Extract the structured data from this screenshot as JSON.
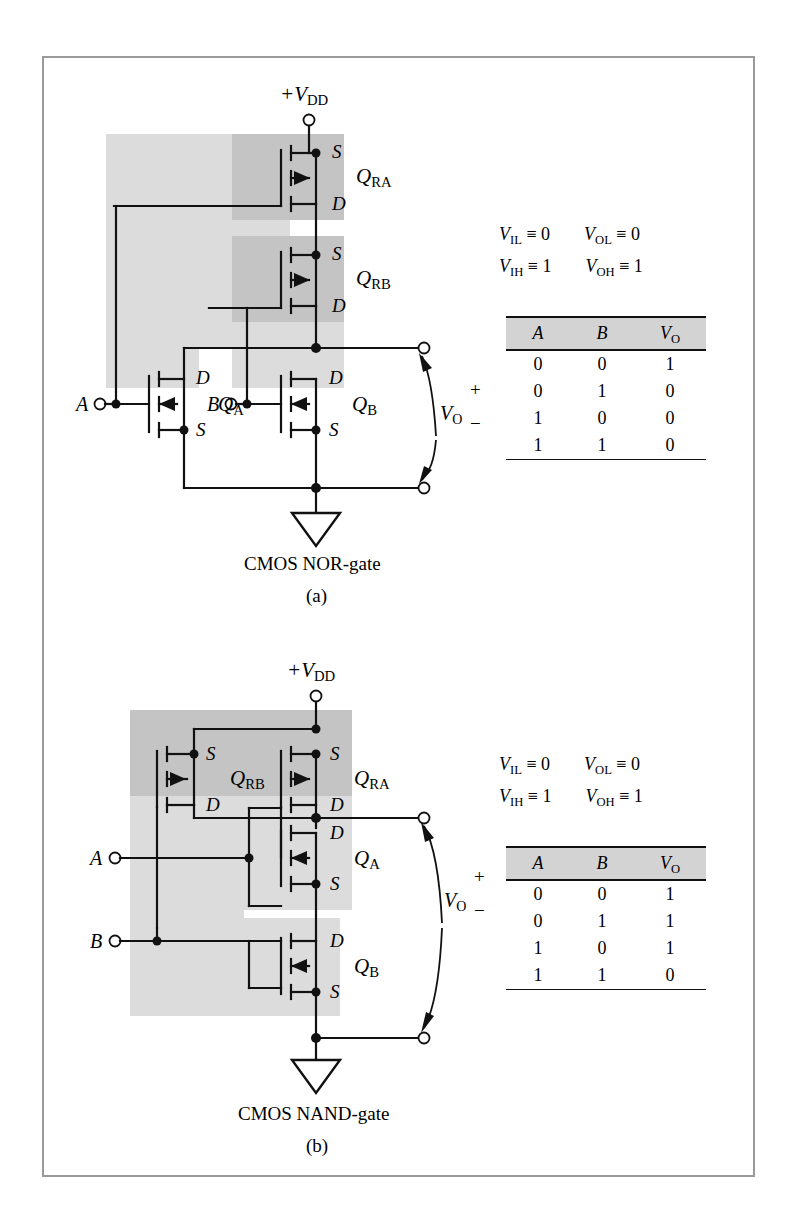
{
  "figure": {
    "frame_border_color": "#9a9a9a",
    "shade_light": "#dcdcdc",
    "shade_dark": "#c4c4c4",
    "wire_color": "#111111"
  },
  "nor": {
    "caption": "CMOS NOR-gate",
    "sub_caption": "(a)",
    "supply_label": "+V",
    "supply_sub": "DD",
    "input_a": "A",
    "input_b": "B",
    "output_label": "V",
    "output_sub": "O",
    "output_plus": "+",
    "output_minus": "−",
    "transistors": [
      {
        "name": "Q",
        "sub": "RA",
        "type": "pmos",
        "top_terminal": "S",
        "bottom_terminal": "D"
      },
      {
        "name": "Q",
        "sub": "RB",
        "type": "pmos",
        "top_terminal": "S",
        "bottom_terminal": "D"
      },
      {
        "name": "Q",
        "sub": "A",
        "type": "nmos",
        "top_terminal": "D",
        "bottom_terminal": "S"
      },
      {
        "name": "Q",
        "sub": "B",
        "type": "nmos",
        "top_terminal": "D",
        "bottom_terminal": "S"
      }
    ],
    "legend": [
      [
        {
          "v": "V",
          "sub": "IL",
          "rel": "≡",
          "val": "0"
        },
        {
          "v": "V",
          "sub": "OL",
          "rel": "≡",
          "val": "0"
        }
      ],
      [
        {
          "v": "V",
          "sub": "IH",
          "rel": "≡",
          "val": "1"
        },
        {
          "v": "V",
          "sub": "OH",
          "rel": "≡",
          "val": "1"
        }
      ]
    ],
    "truth_table": {
      "headers": [
        "A",
        "B",
        "V"
      ],
      "header_sub": [
        "",
        "",
        "O"
      ],
      "rows": [
        [
          "0",
          "0",
          "1"
        ],
        [
          "0",
          "1",
          "0"
        ],
        [
          "1",
          "0",
          "0"
        ],
        [
          "1",
          "1",
          "0"
        ]
      ]
    }
  },
  "nand": {
    "caption": "CMOS NAND-gate",
    "sub_caption": "(b)",
    "supply_label": "+V",
    "supply_sub": "DD",
    "input_a": "A",
    "input_b": "B",
    "output_label": "V",
    "output_sub": "O",
    "output_plus": "+",
    "output_minus": "−",
    "transistors": [
      {
        "name": "Q",
        "sub": "RB",
        "type": "pmos",
        "top_terminal": "S",
        "bottom_terminal": "D"
      },
      {
        "name": "Q",
        "sub": "RA",
        "type": "pmos",
        "top_terminal": "S",
        "bottom_terminal": "D"
      },
      {
        "name": "Q",
        "sub": "A",
        "type": "nmos",
        "top_terminal": "D",
        "bottom_terminal": "S"
      },
      {
        "name": "Q",
        "sub": "B",
        "type": "nmos",
        "top_terminal": "D",
        "bottom_terminal": "S"
      }
    ],
    "legend": [
      [
        {
          "v": "V",
          "sub": "IL",
          "rel": "≡",
          "val": "0"
        },
        {
          "v": "V",
          "sub": "OL",
          "rel": "≡",
          "val": "0"
        }
      ],
      [
        {
          "v": "V",
          "sub": "IH",
          "rel": "≡",
          "val": "1"
        },
        {
          "v": "V",
          "sub": "OH",
          "rel": "≡",
          "val": "1"
        }
      ]
    ],
    "truth_table": {
      "headers": [
        "A",
        "B",
        "V"
      ],
      "header_sub": [
        "",
        "",
        "O"
      ],
      "rows": [
        [
          "0",
          "0",
          "1"
        ],
        [
          "0",
          "1",
          "1"
        ],
        [
          "1",
          "0",
          "1"
        ],
        [
          "1",
          "1",
          "0"
        ]
      ]
    }
  }
}
